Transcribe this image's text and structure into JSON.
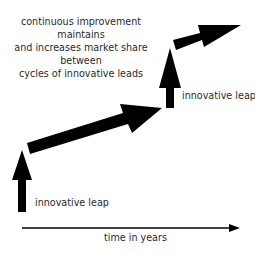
{
  "caption": {
    "lines": [
      "continuous improvement maintains",
      "and increases market share between",
      "cycles of innovative leads"
    ]
  },
  "labels": {
    "leap_1": "innovative leap",
    "leap_2": "innovative leap",
    "x_axis": "time in years"
  },
  "colors": {
    "arrow": "#000000",
    "text": "#2a2a2a",
    "background": "#ffffff"
  },
  "elements": {
    "vertical_arrows": 2,
    "diagonal_arrows": 2,
    "axis": "horizontal time axis with arrowhead"
  }
}
